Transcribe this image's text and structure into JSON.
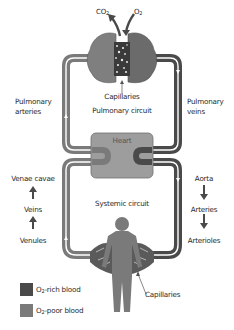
{
  "colors": {
    "o2_rich": "#4a4a4a",
    "o2_poor": "#7a7a7a",
    "heart_fill": "#9d9d9d",
    "pipe_highlight": "#ffffff",
    "text": "#2a2a2a"
  },
  "top": {
    "co2_label": "CO",
    "co2_sub": "2",
    "o2_label": "O",
    "o2_sub": "2"
  },
  "pulmonary": {
    "capillaries_label": "Capillaries",
    "circuit_label": "Pulmonary circuit",
    "arteries_label_line1": "Pulmonary",
    "arteries_label_line2": "arteries",
    "veins_label_line1": "Pulmonary",
    "veins_label_line2": "veins"
  },
  "heart": {
    "label": "Heart"
  },
  "systemic": {
    "circuit_label": "Systemic circuit",
    "capillaries_label": "Capillaries",
    "left_chain": [
      "Venae cavae",
      "Veins",
      "Venules"
    ],
    "right_chain": [
      "Aorta",
      "Arteries",
      "Arterioles"
    ]
  },
  "legend": {
    "items": [
      {
        "prefix": "O",
        "sub": "2",
        "suffix": "-rich blood",
        "color": "#4a4a4a"
      },
      {
        "prefix": "O",
        "sub": "2",
        "suffix": "-poor blood",
        "color": "#7a7a7a"
      }
    ]
  }
}
